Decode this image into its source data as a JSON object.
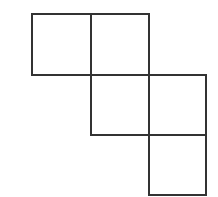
{
  "diagram": {
    "type": "grid-net",
    "line_color": "#333333",
    "background": "#ffffff",
    "line_width": 2,
    "grid": {
      "x_lines": [
        32,
        91,
        149,
        206
      ],
      "y_lines": [
        14,
        75,
        135,
        195
      ]
    },
    "cells": [
      {
        "row": 0,
        "col": 0
      },
      {
        "row": 0,
        "col": 1
      },
      {
        "row": 1,
        "col": 1
      },
      {
        "row": 1,
        "col": 2
      },
      {
        "row": 2,
        "col": 2
      }
    ]
  }
}
